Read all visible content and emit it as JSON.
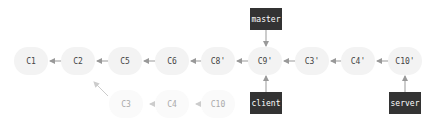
{
  "main_row": [
    {
      "label": "C1",
      "x": 31
    },
    {
      "label": "C2",
      "x": 78
    },
    {
      "label": "C5",
      "x": 125
    },
    {
      "label": "C6",
      "x": 172
    },
    {
      "label": "C8'",
      "x": 218
    },
    {
      "label": "C9'",
      "x": 265
    },
    {
      "label": "C3'",
      "x": 312
    },
    {
      "label": "C4'",
      "x": 358
    },
    {
      "label": "C10'",
      "x": 405
    }
  ],
  "old_row": [
    {
      "label": "C3",
      "x": 126
    },
    {
      "label": "C4",
      "x": 172
    },
    {
      "label": "C10",
      "x": 218
    }
  ],
  "branches": {
    "master": "master",
    "client": "client",
    "server": "server"
  },
  "colors": {
    "branch_bg": "#333333",
    "node_bg": "#f3f3f3",
    "arrow": "#999999",
    "faded_arrow": "#cccccc"
  }
}
